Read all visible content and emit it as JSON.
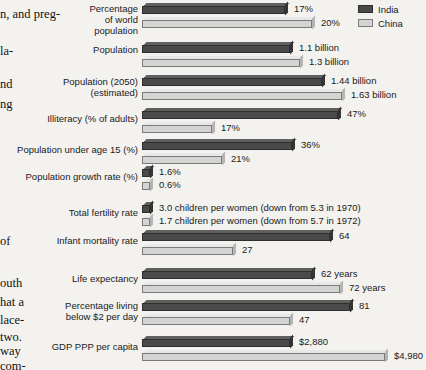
{
  "legend": {
    "items": [
      {
        "label": "India",
        "color": "#4a4a4a",
        "key": "india"
      },
      {
        "label": "China",
        "color": "#d4d4d4",
        "key": "china"
      }
    ]
  },
  "book_text": {
    "lines": [
      {
        "text": "n, and preg-",
        "top": 8
      },
      {
        "text": "la-",
        "top": 45
      },
      {
        "text": "nd",
        "top": 78
      },
      {
        "text": "ng",
        "top": 98
      },
      {
        "text": "of",
        "top": 235
      },
      {
        "text": "outh",
        "top": 277
      },
      {
        "text": "hat a",
        "top": 296
      },
      {
        "text": "lace-",
        "top": 314
      },
      {
        "text": "two.",
        "top": 331
      },
      {
        "text": "way",
        "top": 345
      },
      {
        "text": "com-",
        "top": 360
      }
    ]
  },
  "chart_data": {
    "type": "bar",
    "orientation": "horizontal",
    "title": "",
    "xlabel": "",
    "ylabel": "",
    "grid": false,
    "legend_position": "top-right",
    "series_names": [
      "India",
      "China"
    ],
    "categories": [
      "Percentage of world population",
      "Population",
      "Population (2050) (estimated)",
      "Illiteracy (% of adults)",
      "Population under age 15 (%)",
      "Population growth rate (%)",
      "Total fertility rate",
      "Infant mortality rate",
      "Life expectancy",
      "Percentage living below $2 per day",
      "GDP PPP per capita"
    ],
    "series": [
      {
        "name": "India",
        "values": [
          17,
          1.1,
          1.44,
          47,
          36,
          1.6,
          3.0,
          64,
          62,
          81,
          2880
        ]
      },
      {
        "name": "China",
        "values": [
          20,
          1.3,
          1.63,
          17,
          21,
          0.6,
          1.7,
          27,
          72,
          47,
          4980
        ]
      }
    ]
  },
  "rows": [
    {
      "label": "Percentage\nof world\npopulation",
      "label_top": 3,
      "group_top": 3,
      "india": {
        "value": "17%",
        "width": 143,
        "top": 3
      },
      "china": {
        "value": "20%",
        "width": 170,
        "top": 17
      }
    },
    {
      "label": "Population",
      "label_top": 44,
      "group_top": 42,
      "india": {
        "value": "1.1 billion",
        "width": 148,
        "top": 42
      },
      "china": {
        "value": "1.3 billion",
        "width": 158,
        "top": 56
      }
    },
    {
      "label": "Population (2050)\n(estimated)",
      "label_top": 76,
      "group_top": 75,
      "india": {
        "value": "1.44 billion",
        "width": 180,
        "top": 75
      },
      "china": {
        "value": "1.63 billion",
        "width": 200,
        "top": 89
      }
    },
    {
      "label": "Illiteracy (% of adults)",
      "label_top": 113,
      "group_top": 108,
      "india": {
        "value": "47%",
        "width": 196,
        "top": 108
      },
      "china": {
        "value": "17%",
        "width": 70,
        "top": 122
      }
    },
    {
      "label": "Population under age 15 (%)",
      "label_top": 144,
      "group_top": 139,
      "india": {
        "value": "36%",
        "width": 150,
        "top": 139
      },
      "china": {
        "value": "21%",
        "width": 80,
        "top": 153
      }
    },
    {
      "label": "Population growth rate (%)",
      "label_top": 171,
      "group_top": 166,
      "india": {
        "value": "1.6%",
        "width": 8,
        "top": 166
      },
      "china": {
        "value": "0.6%",
        "width": 8,
        "top": 179
      }
    },
    {
      "label": "Total fertility rate",
      "label_top": 207,
      "group_top": 202,
      "india": {
        "value": "3.0 children per women (down from 5.3 in 1970)",
        "width": 8,
        "top": 202
      },
      "china": {
        "value": "1.7 children per women (down from 5.7 in 1972)",
        "width": 8,
        "top": 215
      }
    },
    {
      "label": "Infant mortality rate",
      "label_top": 235,
      "group_top": 230,
      "india": {
        "value": "64",
        "width": 188,
        "top": 230
      },
      "china": {
        "value": "27",
        "width": 91,
        "top": 244
      }
    },
    {
      "label": "Life expectancy",
      "label_top": 273,
      "group_top": 268,
      "india": {
        "value": "62 years",
        "width": 170,
        "top": 268
      },
      "china": {
        "value": "72 years",
        "width": 198,
        "top": 282
      }
    },
    {
      "label": "Percentage living\nbelow $2 per day",
      "label_top": 300,
      "group_top": 300,
      "india": {
        "value": "81",
        "width": 208,
        "top": 300
      },
      "china": {
        "value": "47",
        "width": 148,
        "top": 314
      }
    },
    {
      "label": "GDP PPP per capita",
      "label_top": 341,
      "group_top": 336,
      "india": {
        "value": "$2,880",
        "width": 148,
        "top": 336
      },
      "china": {
        "value": "$4,980",
        "width": 243,
        "top": 350
      }
    }
  ]
}
